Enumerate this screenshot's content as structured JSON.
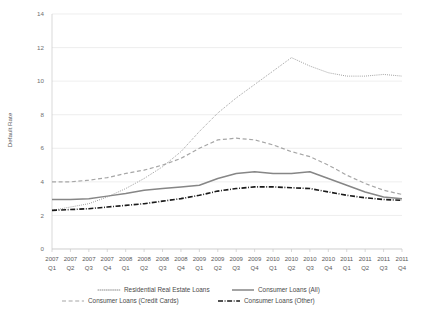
{
  "chart_data": {
    "type": "line",
    "title": "",
    "xlabel": "",
    "ylabel": "Default Rate",
    "ylim": [
      0,
      14
    ],
    "yticks": [
      0,
      2,
      4,
      6,
      8,
      10,
      12,
      14
    ],
    "grid": true,
    "legend_position": "bottom",
    "categories": [
      "2007 Q1",
      "2007 Q2",
      "2007 Q3",
      "2007 Q4",
      "2008 Q1",
      "2008 Q2",
      "2008 Q3",
      "2008 Q4",
      "2009 Q1",
      "2009 Q2",
      "2009 Q3",
      "2009 Q4",
      "2010 Q1",
      "2010 Q2",
      "2010 Q3",
      "2010 Q4",
      "2011 Q1",
      "2011 Q2",
      "2011 Q3",
      "2011 Q4"
    ],
    "x_tick_lines": [
      {
        "year": "2007",
        "quarter": "Q1"
      },
      {
        "year": "2007",
        "quarter": "Q2"
      },
      {
        "year": "2007",
        "quarter": "Q3"
      },
      {
        "year": "2007",
        "quarter": "Q4"
      },
      {
        "year": "2008",
        "quarter": "Q1"
      },
      {
        "year": "2008",
        "quarter": "Q2"
      },
      {
        "year": "2008",
        "quarter": "Q3"
      },
      {
        "year": "2008",
        "quarter": "Q4"
      },
      {
        "year": "2009",
        "quarter": "Q1"
      },
      {
        "year": "2009",
        "quarter": "Q2"
      },
      {
        "year": "2009",
        "quarter": "Q3"
      },
      {
        "year": "2009",
        "quarter": "Q4"
      },
      {
        "year": "2010",
        "quarter": "Q1"
      },
      {
        "year": "2010",
        "quarter": "Q2"
      },
      {
        "year": "2010",
        "quarter": "Q3"
      },
      {
        "year": "2010",
        "quarter": "Q4"
      },
      {
        "year": "2011",
        "quarter": "Q1"
      },
      {
        "year": "2011",
        "quarter": "Q2"
      },
      {
        "year": "2011",
        "quarter": "Q3"
      },
      {
        "year": "2011",
        "quarter": "Q4"
      }
    ],
    "series": [
      {
        "name": "Residential Real Estate Loans",
        "style": "dotted",
        "color": "#8c8c8c",
        "width": 1.0,
        "dash": "0.8,1.3",
        "values": [
          2.3,
          2.5,
          2.7,
          3.1,
          3.6,
          4.2,
          4.9,
          5.8,
          7.0,
          8.1,
          9.0,
          9.8,
          10.6,
          11.4,
          10.9,
          10.5,
          10.3,
          10.3,
          10.4,
          10.3
        ]
      },
      {
        "name": "Consumer Loans (All)",
        "style": "solid",
        "color": "#868686",
        "width": 1.5,
        "dash": "none",
        "values": [
          2.95,
          2.95,
          3.0,
          3.15,
          3.3,
          3.5,
          3.6,
          3.7,
          3.8,
          4.2,
          4.5,
          4.6,
          4.5,
          4.5,
          4.6,
          4.2,
          3.8,
          3.4,
          3.1,
          3.0
        ]
      },
      {
        "name": "Consumer Loans (Credit Cards)",
        "style": "dashed",
        "color": "#a6a6a6",
        "width": 1.2,
        "dash": "4,2.6",
        "values": [
          4.0,
          4.0,
          4.1,
          4.25,
          4.5,
          4.7,
          5.0,
          5.4,
          6.0,
          6.5,
          6.6,
          6.5,
          6.2,
          5.8,
          5.5,
          5.0,
          4.4,
          3.9,
          3.5,
          3.25
        ]
      },
      {
        "name": "Consumer Loans (Other)",
        "style": "dashdot",
        "color": "#1a1a1a",
        "width": 1.6,
        "dash": "5,1.6,0.9,1.6",
        "values": [
          2.3,
          2.35,
          2.4,
          2.5,
          2.6,
          2.7,
          2.85,
          3.0,
          3.2,
          3.45,
          3.6,
          3.7,
          3.7,
          3.65,
          3.6,
          3.4,
          3.2,
          3.05,
          2.95,
          2.9
        ]
      }
    ]
  },
  "legend": {
    "items": [
      {
        "label": "Residential Real Estate Loans"
      },
      {
        "label": "Consumer Loans (All)"
      },
      {
        "label": "Consumer Loans (Credit Cards)"
      },
      {
        "label": "Consumer Loans (Other)"
      }
    ]
  }
}
